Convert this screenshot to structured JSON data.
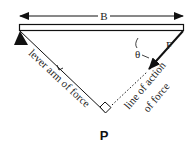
{
  "diagram": {
    "type": "torque lever arm diagram",
    "colors": {
      "ink": "#111111",
      "background": "#ffffff"
    },
    "labels": {
      "span": "B",
      "force": "F",
      "angle": "θ",
      "lever_arm": "L",
      "lever_arm_text": "lever arm of force",
      "line_of_action_line1": "line of action",
      "line_of_action_line2": "of force",
      "point": "P"
    },
    "elements": {
      "beam": "horizontal beam",
      "pivot": "triangular pivot support at left end",
      "force_vector": "force F applied at right end, directed down-left",
      "right_angle_marker": "square marking perpendicular between lever arm and line of action",
      "dimension_arrow": "double-headed arrow spanning beam length B"
    }
  }
}
